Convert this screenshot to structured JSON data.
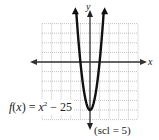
{
  "chart_data": {
    "type": "line",
    "title": "",
    "function_label": "f(x) = x^2 - 25",
    "function_parts": {
      "fname": "f",
      "var": "x",
      "base": "x",
      "exp": "2",
      "rest": "− 25"
    },
    "xlabel": "x",
    "ylabel": "y",
    "scale_note": "(scl = 5)",
    "grid": true,
    "grid_step": 5,
    "xlim": [
      -25,
      25
    ],
    "ylim": [
      -30,
      20
    ],
    "series": [
      {
        "name": "f(x) = x^2 - 25",
        "x": [
          -7,
          -6,
          -5,
          -4,
          -3,
          -2,
          -1,
          0,
          1,
          2,
          3,
          4,
          5,
          6,
          7
        ],
        "y": [
          24,
          11,
          0,
          -9,
          -16,
          -21,
          -24,
          -25,
          -24,
          -21,
          -16,
          -9,
          0,
          11,
          24
        ]
      }
    ],
    "annotations": [
      "vertex at (0, -25)",
      "x-intercepts at -5 and 5"
    ]
  },
  "labels": {
    "y_axis": "y",
    "x_axis": "x",
    "scale": "(scl = 5)",
    "fname": "f",
    "fvar": "x",
    "base": "x",
    "exp": "2",
    "rest": " − 25"
  }
}
